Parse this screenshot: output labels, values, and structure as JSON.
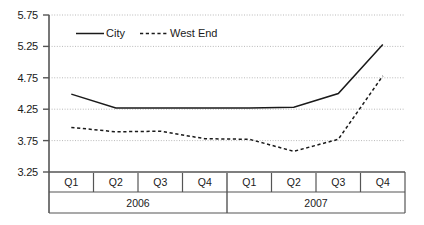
{
  "chart_data": {
    "type": "line",
    "title": "",
    "xlabel": "",
    "ylabel": "",
    "ylim": [
      3.25,
      5.75
    ],
    "ytick_labels": [
      "5.75",
      "5.25",
      "4.75",
      "4.25",
      "3.75",
      "3.25"
    ],
    "yticks": [
      5.75,
      5.25,
      4.75,
      4.25,
      3.75,
      3.25
    ],
    "grid": true,
    "legend_position": "top-left-inside",
    "categories": [
      "Q1",
      "Q2",
      "Q3",
      "Q4",
      "Q1",
      "Q2",
      "Q3",
      "Q4"
    ],
    "group_labels": [
      "2006",
      "2007"
    ],
    "group_spans": [
      4,
      4
    ],
    "series": [
      {
        "name": "City",
        "style": "solid",
        "color": "#1a1a1a",
        "values": [
          4.49,
          4.27,
          4.27,
          4.27,
          4.27,
          4.28,
          4.5,
          5.28
        ]
      },
      {
        "name": "West End",
        "style": "dashed",
        "color": "#1a1a1a",
        "values": [
          3.96,
          3.89,
          3.9,
          3.78,
          3.77,
          3.58,
          3.77,
          4.78
        ]
      }
    ]
  },
  "legend": {
    "items": [
      {
        "label": "City",
        "style": "solid"
      },
      {
        "label": "West End",
        "style": "dashed"
      }
    ]
  }
}
